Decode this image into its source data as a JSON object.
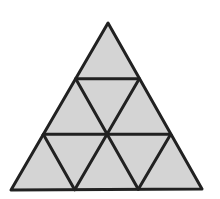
{
  "figure": {
    "name": "subdivided-equilateral-triangle",
    "rows": 3,
    "small_triangle_count": 9,
    "background_color": "#ffffff",
    "fill_color": "#d4d4d4",
    "line_color": "#212121",
    "line_width": 3,
    "outer_vertices": {
      "apex": [
        108,
        23
      ],
      "bottom_left": [
        11,
        190
      ],
      "bottom_right": [
        202,
        189
      ]
    },
    "interior_lines": [
      {
        "name": "upper-horizontal",
        "from": [
          75.7,
          78.7
        ],
        "to": [
          139.3,
          78.7
        ]
      },
      {
        "name": "lower-horizontal",
        "from": [
          43.3,
          134.3
        ],
        "to": [
          170.7,
          134.3
        ]
      },
      {
        "name": "upper-left-leaning",
        "from": [
          139.3,
          78.7
        ],
        "to": [
          74.7,
          189.7
        ]
      },
      {
        "name": "lower-left-leaning",
        "from": [
          170.7,
          134.3
        ],
        "to": [
          138.3,
          189.3
        ]
      },
      {
        "name": "upper-right-leaning",
        "from": [
          75.7,
          78.7
        ],
        "to": [
          138.3,
          189.3
        ]
      },
      {
        "name": "lower-right-leaning",
        "from": [
          43.3,
          134.3
        ],
        "to": [
          74.7,
          189.7
        ]
      }
    ]
  }
}
